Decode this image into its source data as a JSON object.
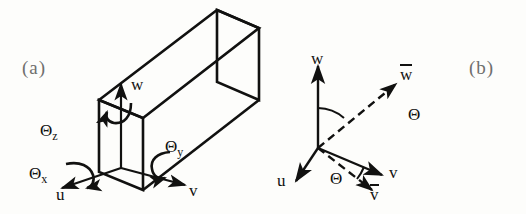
{
  "figure": {
    "background_color": "#fdfdfb",
    "ink_color": "#111110",
    "caption_color": "#6f6f6d"
  },
  "panel_a": {
    "caption": "(a)",
    "axes": [
      {
        "name": "w",
        "label": "w"
      },
      {
        "name": "u",
        "label": "u"
      },
      {
        "name": "v",
        "label": "v"
      }
    ],
    "rotations": [
      {
        "name": "theta-z",
        "symbol": "Θ",
        "subscript": "z"
      },
      {
        "name": "theta-x",
        "symbol": "Θ",
        "subscript": "x"
      },
      {
        "name": "theta-y",
        "symbol": "Θ",
        "subscript": "y"
      }
    ]
  },
  "panel_b": {
    "caption": "(b)",
    "axes": [
      {
        "name": "w",
        "label": "w",
        "style": "solid"
      },
      {
        "name": "u",
        "label": "u",
        "style": "solid"
      },
      {
        "name": "v",
        "label": "v",
        "style": "solid"
      },
      {
        "name": "w-bar",
        "label": "w",
        "style": "dashed",
        "overbar": true
      },
      {
        "name": "v-bar",
        "label": "v",
        "style": "dashed",
        "overbar": true
      }
    ],
    "angles": [
      {
        "name": "theta-upper",
        "symbol": "Θ"
      },
      {
        "name": "theta-lower",
        "symbol": "Θ"
      }
    ]
  }
}
